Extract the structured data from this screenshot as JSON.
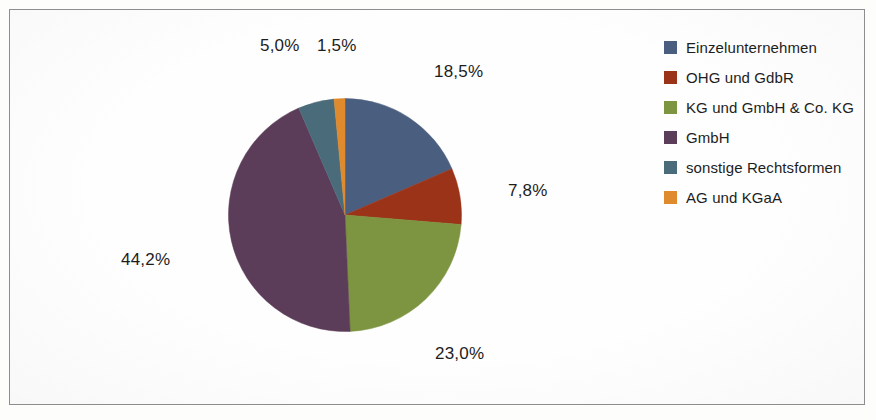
{
  "chart_data": {
    "type": "pie",
    "title": "",
    "subtitle": "",
    "xlabel": "",
    "ylabel": "",
    "legend_position": "right",
    "grid": false,
    "value_suffix": "%",
    "decimal_separator": ",",
    "categories": [
      "Einzelunternehmen",
      "OHG und GdbR",
      "KG und GmbH & Co. KG",
      "GmbH",
      "sonstige Rechtsformen",
      "AG und KGaA"
    ],
    "values": [
      18.5,
      7.8,
      23.0,
      44.2,
      5.0,
      1.5
    ],
    "labels": [
      "18,5%",
      "7,8%",
      "23,0%",
      "44,2%",
      "5,0%",
      "1,5%"
    ],
    "colors": [
      "#4a5f80",
      "#9b3318",
      "#7d9440",
      "#5c3d59",
      "#4a6c7a",
      "#e08a2e"
    ],
    "start_angle_deg": 0,
    "direction": "clockwise"
  },
  "pie": {
    "slices": [
      {
        "name": "Einzelunternehmen",
        "label": "18,5%",
        "value": 18.5,
        "color": "#4a5f80"
      },
      {
        "name": "OHG und GdbR",
        "label": "7,8%",
        "value": 7.8,
        "color": "#9b3318"
      },
      {
        "name": "KG und GmbH & Co. KG",
        "label": "23,0%",
        "value": 23.0,
        "color": "#7d9440"
      },
      {
        "name": "GmbH",
        "label": "44,2%",
        "value": 44.2,
        "color": "#5c3d59"
      },
      {
        "name": "sonstige Rechtsformen",
        "label": "5,0%",
        "value": 5.0,
        "color": "#4a6c7a"
      },
      {
        "name": "AG und KGaA",
        "label": "1,5%",
        "value": 1.5,
        "color": "#e08a2e"
      }
    ]
  },
  "legend": {
    "items": [
      {
        "label": "Einzelunternehmen",
        "color": "#4a5f80"
      },
      {
        "label": "OHG und GdbR",
        "color": "#9b3318"
      },
      {
        "label": "KG und GmbH & Co. KG",
        "color": "#7d9440"
      },
      {
        "label": "GmbH",
        "color": "#5c3d59"
      },
      {
        "label": "sonstige Rechtsformen",
        "color": "#4a6c7a"
      },
      {
        "label": "AG und KGaA",
        "color": "#e08a2e"
      }
    ]
  }
}
